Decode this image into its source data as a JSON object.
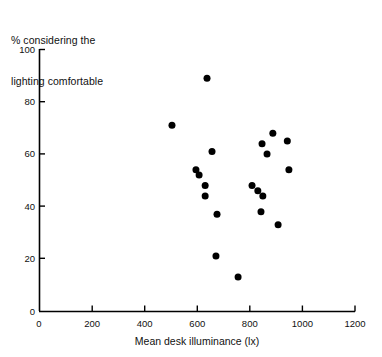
{
  "chart_data": {
    "type": "scatter",
    "title": "",
    "ylabel_line1": "% considering the",
    "ylabel_line2": "lighting comfortable",
    "xlabel": "Mean desk illuminance (lx)",
    "xlim": [
      0,
      1200
    ],
    "ylim": [
      0,
      100
    ],
    "xticks": [
      0,
      200,
      400,
      600,
      800,
      1000,
      1200
    ],
    "yticks": [
      0,
      20,
      40,
      60,
      80,
      100
    ],
    "xticklabels": [
      "0",
      "200",
      "400",
      "600",
      "800",
      "1000",
      "1200"
    ],
    "yticklabels": [
      "0",
      "20",
      "40",
      "60",
      "80",
      "100"
    ],
    "grid": false,
    "legend": "none",
    "marker": "filled-circle",
    "marker_color": "#000000",
    "marker_size_px": 7,
    "n_points": 23,
    "points": [
      {
        "x": 638,
        "y": 89
      },
      {
        "x": 505,
        "y": 71
      },
      {
        "x": 657,
        "y": 61
      },
      {
        "x": 596,
        "y": 54
      },
      {
        "x": 608,
        "y": 52
      },
      {
        "x": 631,
        "y": 48
      },
      {
        "x": 631,
        "y": 44
      },
      {
        "x": 676,
        "y": 37
      },
      {
        "x": 672,
        "y": 21
      },
      {
        "x": 756,
        "y": 13
      },
      {
        "x": 888,
        "y": 68
      },
      {
        "x": 847,
        "y": 64
      },
      {
        "x": 943,
        "y": 65
      },
      {
        "x": 866,
        "y": 60
      },
      {
        "x": 949,
        "y": 54
      },
      {
        "x": 809,
        "y": 48
      },
      {
        "x": 831,
        "y": 46
      },
      {
        "x": 850,
        "y": 44
      },
      {
        "x": 843,
        "y": 38
      },
      {
        "x": 908,
        "y": 33
      }
    ]
  },
  "axes": {
    "x_axis_name": "x-axis",
    "y_axis_name": "y-axis"
  }
}
